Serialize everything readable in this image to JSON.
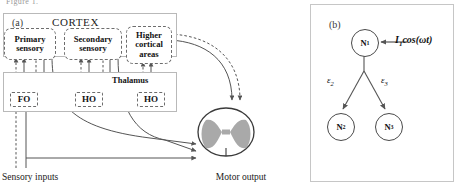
{
  "figure": {
    "clipped_caption": "Figure 1.",
    "panels": [
      {
        "letter": "(a)",
        "name": "cortico-thalamic-spinal-circuit"
      },
      {
        "letter": "(b)",
        "name": "three-neuron-network"
      }
    ]
  },
  "panel_a": {
    "letter": "(a)",
    "cortex_title": "CORTEX",
    "thalamus_title": "Thalamus",
    "modules": [
      {
        "id": "primary-sensory",
        "line1": "Primary",
        "line2": "sensory",
        "line3": ""
      },
      {
        "id": "secondary-sensory",
        "line1": "Secondary",
        "line2": "sensory",
        "line3": ""
      },
      {
        "id": "higher-cortical",
        "line1": "Higher",
        "line2": "cortical",
        "line3": "areas"
      }
    ],
    "nuclei": [
      {
        "id": "first-order-nucleus",
        "label": "FO"
      },
      {
        "id": "higher-order-nucleus-1",
        "label": "HO"
      },
      {
        "id": "higher-order-nucleus-2",
        "label": "HO"
      }
    ],
    "input_label": "Sensory inputs",
    "output_label": "Motor output",
    "colors": {
      "line": "#555555",
      "module_border": "#6d6d6d",
      "frame": "#b9b9b9",
      "gray_matter": "#a9a9a9"
    }
  },
  "panel_b": {
    "letter": "(b)",
    "nodes": [
      {
        "id": "node-n1",
        "label": "N",
        "sub": "1"
      },
      {
        "id": "node-n2",
        "label": "N",
        "sub": "2"
      },
      {
        "id": "node-n3",
        "label": "N",
        "sub": "3"
      }
    ],
    "drive": {
      "symbol": "I",
      "sub": "1",
      "expr": "cos(ωt)"
    },
    "edges": [
      {
        "id": "edge-n1-n2",
        "label": "ε",
        "sub": "2"
      },
      {
        "id": "edge-n1-n3",
        "label": "ε",
        "sub": "3"
      }
    ],
    "colors": {
      "node_border": "#4a4a4a",
      "edge": "#555555",
      "frame": "#c6c6c6"
    }
  }
}
